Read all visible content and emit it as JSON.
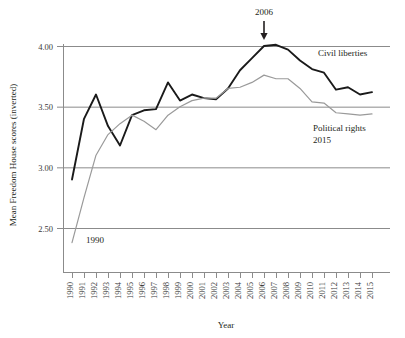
{
  "chart_data": {
    "type": "line",
    "title": "",
    "xlabel": "Year",
    "ylabel": "Mean Freedom House scores (inverted)",
    "xlim": [
      1990,
      2015
    ],
    "ylim": [
      2.18,
      4.12
    ],
    "yticks": [
      "4.00",
      "3.50",
      "3.00",
      "2.50"
    ],
    "ytick_values": [
      4.0,
      3.5,
      3.0,
      2.5
    ],
    "grid": "horizontal",
    "legend_position": "inline-right",
    "categories": [
      "1990",
      "1991",
      "1992",
      "1993",
      "1994",
      "1995",
      "1996",
      "1997",
      "1998",
      "1999",
      "2000",
      "2001",
      "2002",
      "2003",
      "2004",
      "2005",
      "2006",
      "2007",
      "2008",
      "2009",
      "2010",
      "2011",
      "2012",
      "2013",
      "2014",
      "2015"
    ],
    "series": [
      {
        "name": "Civil liberties",
        "color": "#1a1a1a",
        "values": [
          2.9,
          3.4,
          3.6,
          3.34,
          3.18,
          3.43,
          3.47,
          3.48,
          3.7,
          3.55,
          3.6,
          3.57,
          3.56,
          3.65,
          3.8,
          3.9,
          4.0,
          4.01,
          3.97,
          3.88,
          3.81,
          3.78,
          3.64,
          3.66,
          3.6,
          3.62
        ]
      },
      {
        "name": "Political rights",
        "color": "#9a9a9a",
        "values": [
          2.38,
          2.75,
          3.1,
          3.27,
          3.36,
          3.43,
          3.38,
          3.31,
          3.43,
          3.5,
          3.55,
          3.57,
          3.57,
          3.65,
          3.66,
          3.7,
          3.76,
          3.73,
          3.73,
          3.65,
          3.54,
          3.53,
          3.45,
          3.44,
          3.43,
          3.44
        ]
      }
    ],
    "annotations": [
      {
        "text": "2006",
        "target_year": "2006",
        "kind": "arrow-down"
      },
      {
        "text": "1990",
        "target_year": "1990",
        "kind": "point-label"
      },
      {
        "text": "Civil liberties",
        "kind": "series-label"
      },
      {
        "text": "Political rights",
        "kind": "series-label"
      },
      {
        "text": "2015",
        "kind": "series-label-sub"
      }
    ]
  },
  "labels": {
    "y_axis_title": "Mean Freedom House scores (inverted)",
    "x_axis_title": "Year",
    "annotation_2006": "2006",
    "annotation_1990": "1990",
    "civil_liberties": "Civil liberties",
    "political_rights": "Political rights",
    "political_rights_year": "2015"
  }
}
